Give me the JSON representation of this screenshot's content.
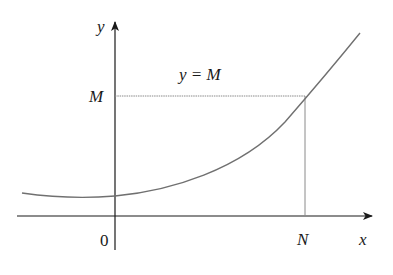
{
  "diagram": {
    "axes": {
      "x_label": "x",
      "y_label": "y",
      "origin_label": "0"
    },
    "annotations": {
      "line_label": "y = M",
      "M_tick_label": "M",
      "N_tick_label": "N"
    },
    "colors": {
      "axis": "#1a1a1a",
      "curve": "#707070",
      "guide": "#8a8a8a",
      "text": "#1a1a1a",
      "background": "#ffffff"
    }
  }
}
